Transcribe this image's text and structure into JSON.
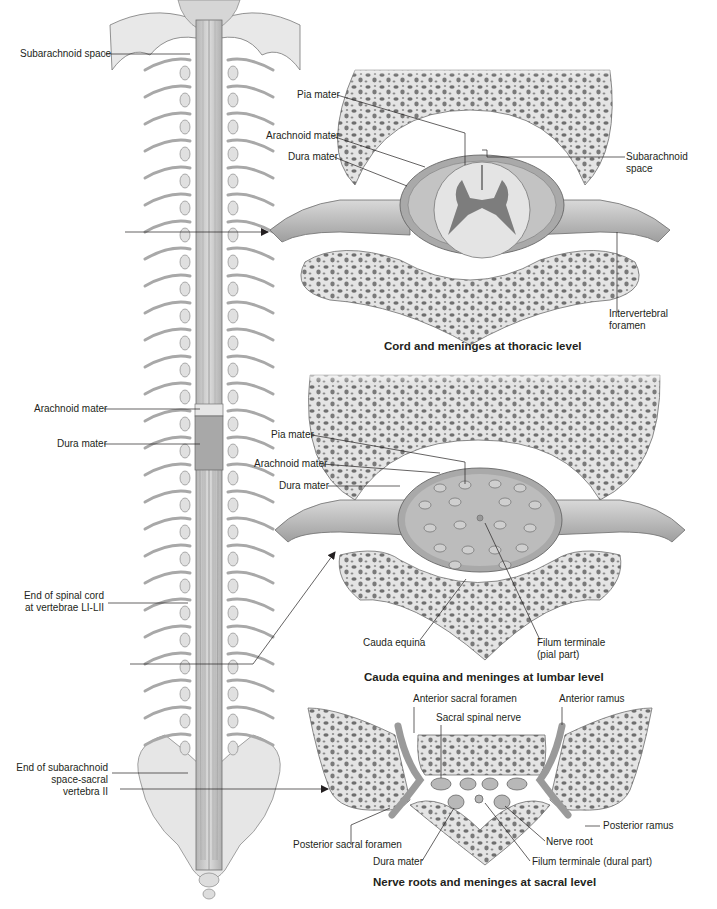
{
  "colors": {
    "bone_fill": "#e6e6e6",
    "bone_outline": "#6d6d6d",
    "trabecular": "#707070",
    "dura": "#9a9a9a",
    "cord": "#d8d8d8",
    "gray_matter": "#7d7d7d",
    "nerve": "#bdbdbd",
    "line": "#231f20"
  },
  "spine_overview": {
    "labels": {
      "subarachnoid_space": "Subarachnoid space",
      "arachnoid_mater": "Arachnoid mater",
      "dura_mater": "Dura mater",
      "end_spinal_cord_l1": "End of spinal cord",
      "end_spinal_cord_l2": "at vertebrae LI-LII",
      "end_subarachnoid_l1": "End of subarachnoid",
      "end_subarachnoid_l2": "space-sacral",
      "end_subarachnoid_l3": "vertebra II"
    }
  },
  "thoracic_panel": {
    "caption": "Cord and meninges at thoracic level",
    "labels": {
      "pia_mater": "Pia mater",
      "arachnoid_mater": "Arachnoid mater",
      "dura_mater": "Dura mater",
      "subarachnoid_l1": "Subarachnoid",
      "subarachnoid_l2": "space",
      "intervertebral_l1": "Intervertebral",
      "intervertebral_l2": "foramen"
    }
  },
  "lumbar_panel": {
    "caption": "Cauda equina and meninges at lumbar level",
    "labels": {
      "pia_mater": "Pia mater",
      "arachnoid_mater": "Arachnoid mater",
      "dura_mater": "Dura mater",
      "cauda_equina": "Cauda equina",
      "filum_pial_l1": "Filum terminale",
      "filum_pial_l2": "(pial part)"
    }
  },
  "sacral_panel": {
    "caption": "Nerve roots and meninges at sacral level",
    "labels": {
      "anterior_sacral_foramen": "Anterior sacral foramen",
      "anterior_ramus": "Anterior ramus",
      "sacral_spinal_nerve": "Sacral spinal nerve",
      "posterior_ramus": "Posterior ramus",
      "nerve_root": "Nerve root",
      "posterior_sacral_foramen": "Posterior sacral foramen",
      "dura_mater": "Dura mater",
      "filum_dural": "Filum terminale (dural part)"
    }
  }
}
